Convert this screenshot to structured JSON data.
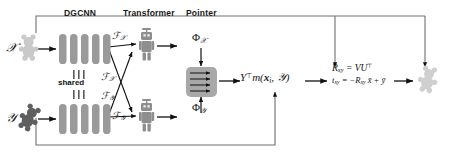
{
  "figure": {
    "title_headers": [
      {
        "label": "DGCNN",
        "x": 70,
        "y": 11
      },
      {
        "label": "Transformer",
        "x": 126,
        "y": 11
      },
      {
        "label": "Pointer",
        "x": 187,
        "y": 11
      }
    ],
    "inputs": [
      {
        "name": "source-point-cloud",
        "symbol": "X",
        "icon": "bear-icon-light",
        "x": 10,
        "y": 36
      },
      {
        "name": "target-point-cloud",
        "symbol": "Y",
        "icon": "bear-icon-dark",
        "x": 10,
        "y": 106
      }
    ],
    "shared_label": "shared",
    "feature_labels": [
      {
        "text": "F",
        "subscript": "X",
        "x": 113,
        "y": 34
      },
      {
        "text": "F",
        "subscript": "X",
        "x": 104,
        "y": 75
      },
      {
        "text": "F",
        "subscript": "Y",
        "x": 104,
        "y": 94
      },
      {
        "text": "F",
        "subscript": "Y",
        "x": 113,
        "y": 113
      }
    ],
    "phi_labels": [
      {
        "text": "Φ",
        "subscript": "X",
        "x": 192,
        "y": 36
      },
      {
        "text": "Φ",
        "subscript": "Y",
        "x": 192,
        "y": 107
      }
    ],
    "svd_expression": "Y⊤m(xᵢ, Y)",
    "equations": [
      {
        "name": "rotation-equation",
        "text": "Rₓᵧ = VU⊤"
      },
      {
        "name": "translation-equation",
        "text": "tₓᵧ = −Rₓᵧ x̄ + ȳ"
      }
    ],
    "output": {
      "name": "aligned-point-cloud",
      "icon": "bear-icon-light"
    },
    "colors": {
      "bar_gray": "#9a9a9a",
      "pointer_gray": "#a8a8a8",
      "line_black": "#111111",
      "frame_gray": "#7a7a7a",
      "bear_light": "#c9c9c9",
      "bear_dark": "#5f5f5f",
      "robot_gray": "#8e8e8e"
    }
  }
}
